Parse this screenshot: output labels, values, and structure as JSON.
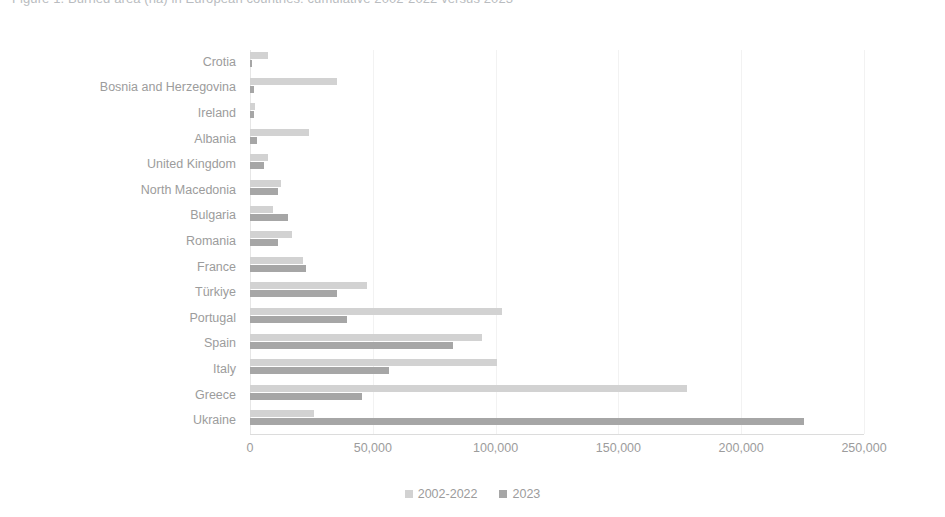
{
  "title": {
    "text": "Figure 1. Burned area (ha) in European countries: cumulative 2002-2022 versus 2023",
    "clipped": true
  },
  "colors": {
    "series_2002_2022": "#d2d2d2",
    "series_2023": "#a6a6a6",
    "gridline": "#f2f2f2",
    "axis_line": "#dcdcdc",
    "text": "#9c9c9c",
    "background": "#ffffff"
  },
  "legend": {
    "position": "bottom-center",
    "items": [
      {
        "label": "2002-2022",
        "color": "#d2d2d2"
      },
      {
        "label": "2023",
        "color": "#a6a6a6"
      }
    ]
  },
  "axis": {
    "x_ticks": [
      "0",
      "50,000",
      "100,000",
      "150,000",
      "200,000",
      "250,000"
    ],
    "x_tick_values": [
      0,
      50000,
      100000,
      150000,
      200000,
      250000
    ]
  },
  "chart_data": {
    "type": "bar",
    "orientation": "horizontal",
    "title": "Figure 1. Burned area (ha) in European countries: cumulative 2002-2022 versus 2023",
    "xlabel": "",
    "ylabel": "",
    "xlim": [
      0,
      250000
    ],
    "grid": true,
    "legend_position": "bottom-center",
    "categories": [
      "Crotia",
      "Bosnia and Herzegovina",
      "Ireland",
      "Albania",
      "United Kingdom",
      "North Macedonia",
      "Bulgaria",
      "Romania",
      "France",
      "Türkiye",
      "Portugal",
      "Spain",
      "Italy",
      "Greece",
      "Ukraine"
    ],
    "series": [
      {
        "name": "2002-2022",
        "color": "#d2d2d2",
        "values": [
          7500,
          35500,
          2000,
          24000,
          7500,
          12500,
          9500,
          17000,
          21500,
          47500,
          102500,
          94500,
          100500,
          178000,
          26000
        ]
      },
      {
        "name": "2023",
        "color": "#a6a6a6",
        "values": [
          1000,
          1500,
          1500,
          3000,
          5500,
          11500,
          15500,
          11500,
          23000,
          35500,
          39500,
          82500,
          56500,
          45500,
          225500
        ]
      }
    ]
  }
}
